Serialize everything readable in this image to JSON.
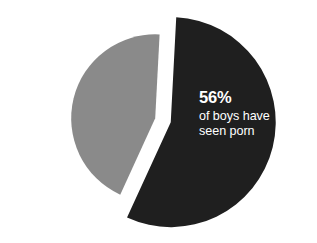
{
  "chart_data": {
    "type": "pie",
    "title": "",
    "subtitle": "",
    "xlabel": "",
    "ylabel": "",
    "legend_position": "none",
    "grid": false,
    "exploded": true,
    "categories": [
      "of boys have seen porn",
      "other"
    ],
    "values": [
      56,
      44
    ],
    "slices": [
      {
        "name": "of boys have seen porn",
        "value": 56,
        "value_label": "56%",
        "color": "#1f1f1f",
        "label_lines": [
          "of boys have",
          "seen porn"
        ],
        "label_color": "#ffffff"
      },
      {
        "name": "other",
        "value": 44,
        "value_label": "",
        "color": "#8a8a8a",
        "label_lines": [],
        "label_color": ""
      }
    ],
    "annotations": [
      {
        "value": "56%",
        "line1": "of boys have",
        "line2": "seen porn"
      }
    ]
  },
  "colors": {
    "background": "#ffffff",
    "highlight_slice": "#1f1f1f",
    "secondary_slice": "#8a8a8a",
    "label_text": "#ffffff"
  },
  "label": {
    "percent": "56%",
    "line1": "of boys have",
    "line2": "seen porn"
  }
}
